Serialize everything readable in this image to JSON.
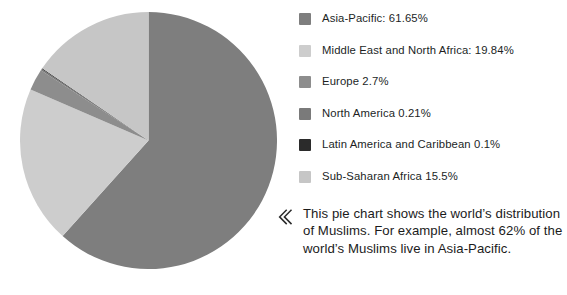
{
  "chart_data": {
    "type": "pie",
    "title": "",
    "categories": [
      "Asia-Pacific",
      "Middle East and North Africa",
      "Europe",
      "North America",
      "Latin America and Caribbean",
      "Sub-Saharan Africa"
    ],
    "values": [
      61.65,
      19.84,
      2.7,
      0.21,
      0.1,
      15.5
    ],
    "unit": "%",
    "legend_position": "right",
    "start_angle_deg": 0,
    "direction": "clockwise",
    "grid": false,
    "colors": [
      "#7e7e7e",
      "#cdcdcd",
      "#8d8d8d",
      "#7a7a7a",
      "#2b2b2b",
      "#c6c6c6"
    ],
    "slices": [
      {
        "label": "Asia-Pacific",
        "value": 61.65,
        "color": "#7e7e7e",
        "legend_text": "Asia-Pacific: 61.65%"
      },
      {
        "label": "Middle East and North Africa",
        "value": 19.84,
        "color": "#cdcdcd",
        "legend_text": "Middle East and North Africa: 19.84%"
      },
      {
        "label": "Europe",
        "value": 2.7,
        "color": "#8d8d8d",
        "legend_text": "Europe 2.7%"
      },
      {
        "label": "North America",
        "value": 0.21,
        "color": "#7a7a7a",
        "legend_text": "North America 0.21%"
      },
      {
        "label": "Latin America and Caribbean",
        "value": 0.1,
        "color": "#2b2b2b",
        "legend_text": "Latin America and Caribbean 0.1%"
      },
      {
        "label": "Sub-Saharan Africa",
        "value": 15.5,
        "color": "#c6c6c6",
        "legend_text": "Sub-Saharan Africa 15.5%"
      }
    ]
  },
  "legend": {
    "items": [
      {
        "label": "Asia-Pacific: 61.65%",
        "color": "#7e7e7e"
      },
      {
        "label": "Middle East and North Africa: 19.84%",
        "color": "#cdcdcd"
      },
      {
        "label": "Europe 2.7%",
        "color": "#8d8d8d"
      },
      {
        "label": "North America 0.21%",
        "color": "#7a7a7a"
      },
      {
        "label": "Latin America and Caribbean 0.1%",
        "color": "#2b2b2b"
      },
      {
        "label": "Sub-Saharan Africa 15.5%",
        "color": "#c6c6c6"
      }
    ]
  },
  "caption": {
    "icon": "double-chevron-left-icon",
    "text": "This pie chart shows the world’s distribution of Muslims. For example, almost 62% of the world’s Muslims live in Asia-Pacific."
  }
}
